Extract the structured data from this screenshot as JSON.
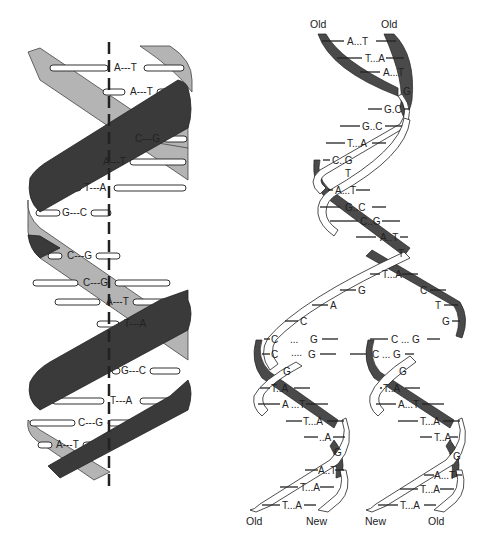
{
  "figure": {
    "left_panel": {
      "description": "DNA double helix with vertical dashed axis",
      "colors": {
        "front_strand": "#3a3a3a",
        "back_strand": "#b4b4b4",
        "axis": "#222222"
      },
      "base_pairs": [
        "A---T",
        "A---T",
        "C---G",
        "A---T",
        "T---A",
        "G---C",
        "C---G",
        "C---G",
        "A---T",
        "T---A",
        "G---C",
        "T---A",
        "C---G",
        "A---T"
      ]
    },
    "right_panel": {
      "description": "Semiconservative DNA replication fork",
      "top_labels": {
        "left": "Old",
        "right": "Old"
      },
      "bottom_labels": {
        "a": "Old",
        "b": "New",
        "c": "New",
        "d": "Old"
      },
      "colors": {
        "dark_strand": "#4a4a4a",
        "light_strand": "#ffffff"
      },
      "parent_pairs": [
        "A...T",
        "T...A",
        "A...T",
        "G",
        "G.C",
        "G..C",
        "T...A",
        "C..G",
        "T",
        "A...T",
        "G..C",
        "C..G",
        "A..T",
        "T"
      ],
      "fork": {
        "pairs": [
          "T...A"
        ],
        "left_bases": [
          "G",
          "A",
          "C"
        ],
        "right_bases": [
          "C",
          "T",
          "G"
        ],
        "row1": {
          "left": "C",
          "mid": "...",
          "leftg": "G",
          "right": "C ... G"
        },
        "row2": {
          "left": "C",
          "mid": "....",
          "leftg": "G",
          "right": "C ... G"
        }
      },
      "left_daughter": [
        "G",
        "T..A",
        "A ...T",
        "T...A",
        "..A",
        "G",
        "A..T",
        "T...A",
        "T...A"
      ],
      "right_daughter": [
        "G",
        "T..A",
        "A...T",
        "T...A",
        "T..A",
        "G",
        "A...T",
        "T...A",
        "T...A"
      ]
    }
  }
}
